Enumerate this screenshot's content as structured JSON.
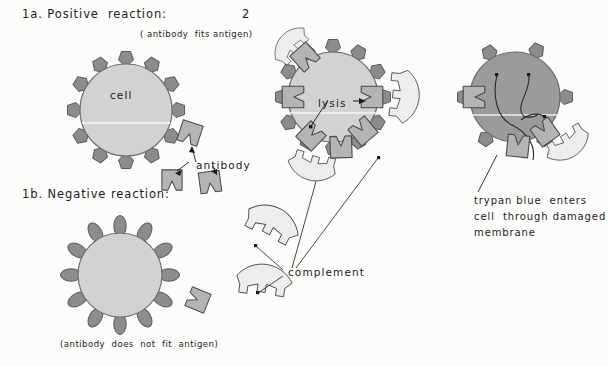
{
  "figure": {
    "page_number": "2",
    "background_color": "#fcfcfa",
    "palette": {
      "cell_fill": "#d2d2d2",
      "cell_stroke": "#6e6e6e",
      "antigen_fill": "#8c8c8c",
      "antigen_stroke": "#5a5a5a",
      "antibody_fill": "#b4b4b4",
      "antibody_stroke": "#4a4a4a",
      "complement_fill": "#ededed",
      "complement_stroke": "#4a4a4a",
      "stained_cell_fill": "#9b9b9b",
      "ink": "#1b1b1b"
    }
  },
  "headings": {
    "positive": "1a. Positive  reaction:",
    "negative": "1b. Negative reaction:"
  },
  "captions": {
    "fits": "( antibody  fits antigen)",
    "does_not_fit": "(antibody  does  not  fit  antigen)"
  },
  "labels": {
    "cell": "cell",
    "antibody": "antibody",
    "lysis": "lysis",
    "complement": "complement",
    "trypan_line1": "trypan blue  enters",
    "trypan_line2": "cell  through damaged",
    "trypan_line3": "membrane"
  },
  "panels": [
    {
      "id": "panel-1a-cell",
      "name": "positive-reaction-cell",
      "center": [
        126,
        110
      ],
      "radius": 46,
      "antigen_count": 12,
      "antigen_shape": "pointed-triangle",
      "state": "unbound"
    },
    {
      "id": "panel-1b-cell",
      "name": "negative-reaction-cell",
      "center": [
        120,
        275
      ],
      "radius": 42,
      "antigen_count": 12,
      "antigen_shape": "oval",
      "state": "unbound"
    },
    {
      "id": "panel-2-cell",
      "name": "lysing-cell",
      "center": [
        333,
        97
      ],
      "radius": 45,
      "antigen_count": 12,
      "antigen_shape": "pointed-triangle",
      "state": "antibody-and-complement-bound"
    },
    {
      "id": "panel-3-cell",
      "name": "trypan-blue-stained-cell",
      "center": [
        515,
        97
      ],
      "radius": 45,
      "antigen_count": 6,
      "antigen_shape": "pointed-triangle",
      "state": "stained-damaged-membrane"
    }
  ],
  "free_antibodies": [
    {
      "name": "free-antibody-upper",
      "x": 190,
      "y": 133
    },
    {
      "name": "free-antibody-lower-left",
      "x": 172,
      "y": 180
    },
    {
      "name": "free-antibody-lower-right",
      "x": 210,
      "y": 182
    },
    {
      "name": "free-antibody-negative-panel",
      "x": 196,
      "y": 296
    }
  ],
  "free_complements": [
    {
      "name": "free-complement-upper",
      "x": 258,
      "y": 228
    },
    {
      "name": "free-complement-lower",
      "x": 252,
      "y": 285
    }
  ]
}
